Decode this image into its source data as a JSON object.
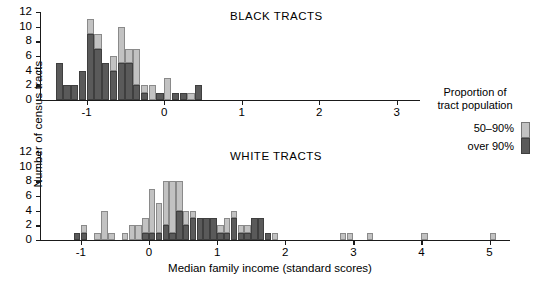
{
  "figure": {
    "ylabel": "Number of census tracts",
    "xlabel": "Median family income (standard scores)"
  },
  "legend": {
    "title_line1": "Proportion of",
    "title_line2": "tract population",
    "items": [
      {
        "label": "50–90%",
        "color": "#c2c2c2"
      },
      {
        "label": "over 90%",
        "color": "#5a5a5a"
      }
    ]
  },
  "chart_data": [
    {
      "type": "bar",
      "subtype": "stacked-histogram",
      "title": "BLACK TRACTS",
      "xlabel": "Median family income (standard scores)",
      "ylabel": "Number of census tracts",
      "xlim": [
        -1.6,
        3.3
      ],
      "ylim": [
        0,
        12
      ],
      "yticks": [
        0,
        2,
        4,
        6,
        8,
        10,
        12
      ],
      "xticks": [
        -1,
        0,
        1,
        2,
        3
      ],
      "bin_width": 0.1,
      "grid": false,
      "legend_position": "right",
      "bin_left_edges": [
        -1.4,
        -1.3,
        -1.2,
        -1.1,
        -1.0,
        -0.9,
        -0.8,
        -0.7,
        -0.6,
        -0.5,
        -0.4,
        -0.3,
        -0.2,
        -0.1,
        0.0,
        0.1,
        0.2,
        0.3,
        0.4
      ],
      "series": [
        {
          "name": "over 90%",
          "color": "#5a5a5a",
          "values": [
            5,
            2,
            2,
            4,
            9,
            7,
            5,
            4,
            5,
            5,
            2,
            1,
            0,
            1,
            0,
            1,
            1,
            0,
            2
          ]
        },
        {
          "name": "50–90%",
          "color": "#c2c2c2",
          "values": [
            0,
            0,
            0,
            0,
            2,
            2,
            0,
            2,
            5,
            2,
            5,
            1,
            2,
            0,
            3,
            0,
            0,
            1,
            0
          ]
        }
      ],
      "totals": [
        5,
        2,
        2,
        4,
        11,
        9,
        5,
        6,
        10,
        7,
        7,
        2,
        2,
        1,
        3,
        1,
        1,
        1,
        2
      ]
    },
    {
      "type": "bar",
      "subtype": "stacked-histogram",
      "title": "WHITE TRACTS",
      "xlabel": "Median family income (standard scores)",
      "ylabel": "Number of census tracts",
      "xlim": [
        -1.6,
        5.3
      ],
      "ylim": [
        0,
        12
      ],
      "yticks": [
        0,
        2,
        4,
        6,
        8,
        10,
        12
      ],
      "xticks": [
        -1,
        0,
        1,
        2,
        3,
        4,
        5
      ],
      "bin_width": 0.1,
      "grid": false,
      "legend_position": "right",
      "bin_left_edges": [
        -1.1,
        -1.0,
        -0.8,
        -0.7,
        -0.6,
        -0.4,
        -0.3,
        -0.2,
        -0.1,
        0.0,
        0.1,
        0.2,
        0.3,
        0.4,
        0.5,
        0.6,
        0.7,
        0.8,
        0.9,
        1.0,
        1.1,
        1.2,
        1.3,
        1.4,
        1.5,
        1.6,
        1.7,
        1.8,
        1.9,
        2.8,
        2.9,
        3.2,
        4.0,
        5.0
      ],
      "series": [
        {
          "name": "over 90%",
          "color": "#5a5a5a",
          "values": [
            1,
            1,
            0,
            0,
            0,
            0,
            0,
            0,
            1,
            1,
            1,
            2,
            1,
            4,
            2,
            3,
            3,
            3,
            3,
            1,
            1,
            3,
            1,
            1,
            3,
            3,
            1,
            0,
            0,
            0,
            0,
            0,
            0,
            0
          ]
        },
        {
          "name": "50–90%",
          "color": "#c2c2c2",
          "values": [
            0,
            1,
            1,
            4,
            1,
            1,
            2,
            2,
            2,
            6,
            4,
            6,
            7,
            4,
            2,
            1,
            0,
            0,
            0,
            1,
            2,
            1,
            1,
            1,
            0,
            0,
            0,
            1,
            0,
            1,
            1,
            1,
            1,
            1
          ]
        }
      ],
      "totals": [
        1,
        2,
        1,
        4,
        1,
        1,
        2,
        2,
        3,
        7,
        5,
        8,
        8,
        8,
        4,
        4,
        3,
        3,
        3,
        2,
        3,
        4,
        2,
        2,
        3,
        3,
        1,
        1,
        0,
        1,
        1,
        1,
        1,
        1
      ]
    }
  ]
}
